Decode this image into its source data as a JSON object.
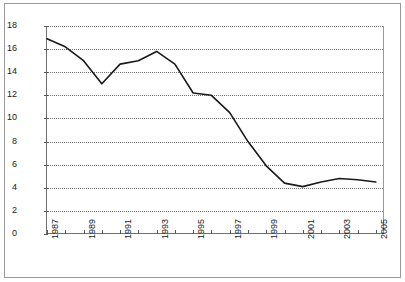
{
  "chart_data": {
    "type": "line",
    "title": "",
    "subtitle": "",
    "xlabel": "",
    "ylabel": "",
    "grid": "horizontal-dotted",
    "legend": "none",
    "xlim": [
      1987,
      2005.5
    ],
    "ylim": [
      0,
      18
    ],
    "ytick_step": 2,
    "ytick_labels": [
      "18",
      "16",
      "14",
      "12",
      "10",
      "8",
      "6",
      "4",
      "2",
      "0"
    ],
    "ytick_values": [
      18,
      16,
      14,
      12,
      10,
      8,
      6,
      4,
      2,
      0
    ],
    "xtick_labels": [
      "1987",
      "1989",
      "1991",
      "1993",
      "1995",
      "1997",
      "1999",
      "2001",
      "2003",
      "2005"
    ],
    "xtick_values": [
      1987,
      1989,
      1991,
      1993,
      1995,
      1997,
      1999,
      2001,
      2003,
      2005
    ],
    "x_minor_ticks": [
      1987,
      1988,
      1989,
      1990,
      1991,
      1992,
      1993,
      1994,
      1995,
      1996,
      1997,
      1998,
      1999,
      2000,
      2001,
      2002,
      2003,
      2004,
      2005
    ],
    "series": [
      {
        "name": "series-1",
        "color": "#1a1a1a",
        "x": [
          1987,
          1988,
          1989,
          1990,
          1991,
          1992,
          1993,
          1994,
          1995,
          1996,
          1997,
          1998,
          1999,
          2000,
          2001,
          2002,
          2003,
          2004,
          2005
        ],
        "values": [
          16.9,
          16.2,
          15.0,
          13.0,
          14.7,
          15.0,
          15.8,
          14.7,
          12.2,
          12.0,
          10.5,
          8.0,
          5.9,
          4.4,
          4.1,
          4.5,
          4.8,
          4.7,
          4.5
        ]
      }
    ]
  },
  "axes": {
    "y_label_color": "#1a1a1a",
    "x_label_color": "#1a1a1a",
    "grid_color": "#6f6f6f",
    "axis_color": "#5a5a5a",
    "frame_color": "#9a9a9a",
    "background": "#ffffff"
  }
}
